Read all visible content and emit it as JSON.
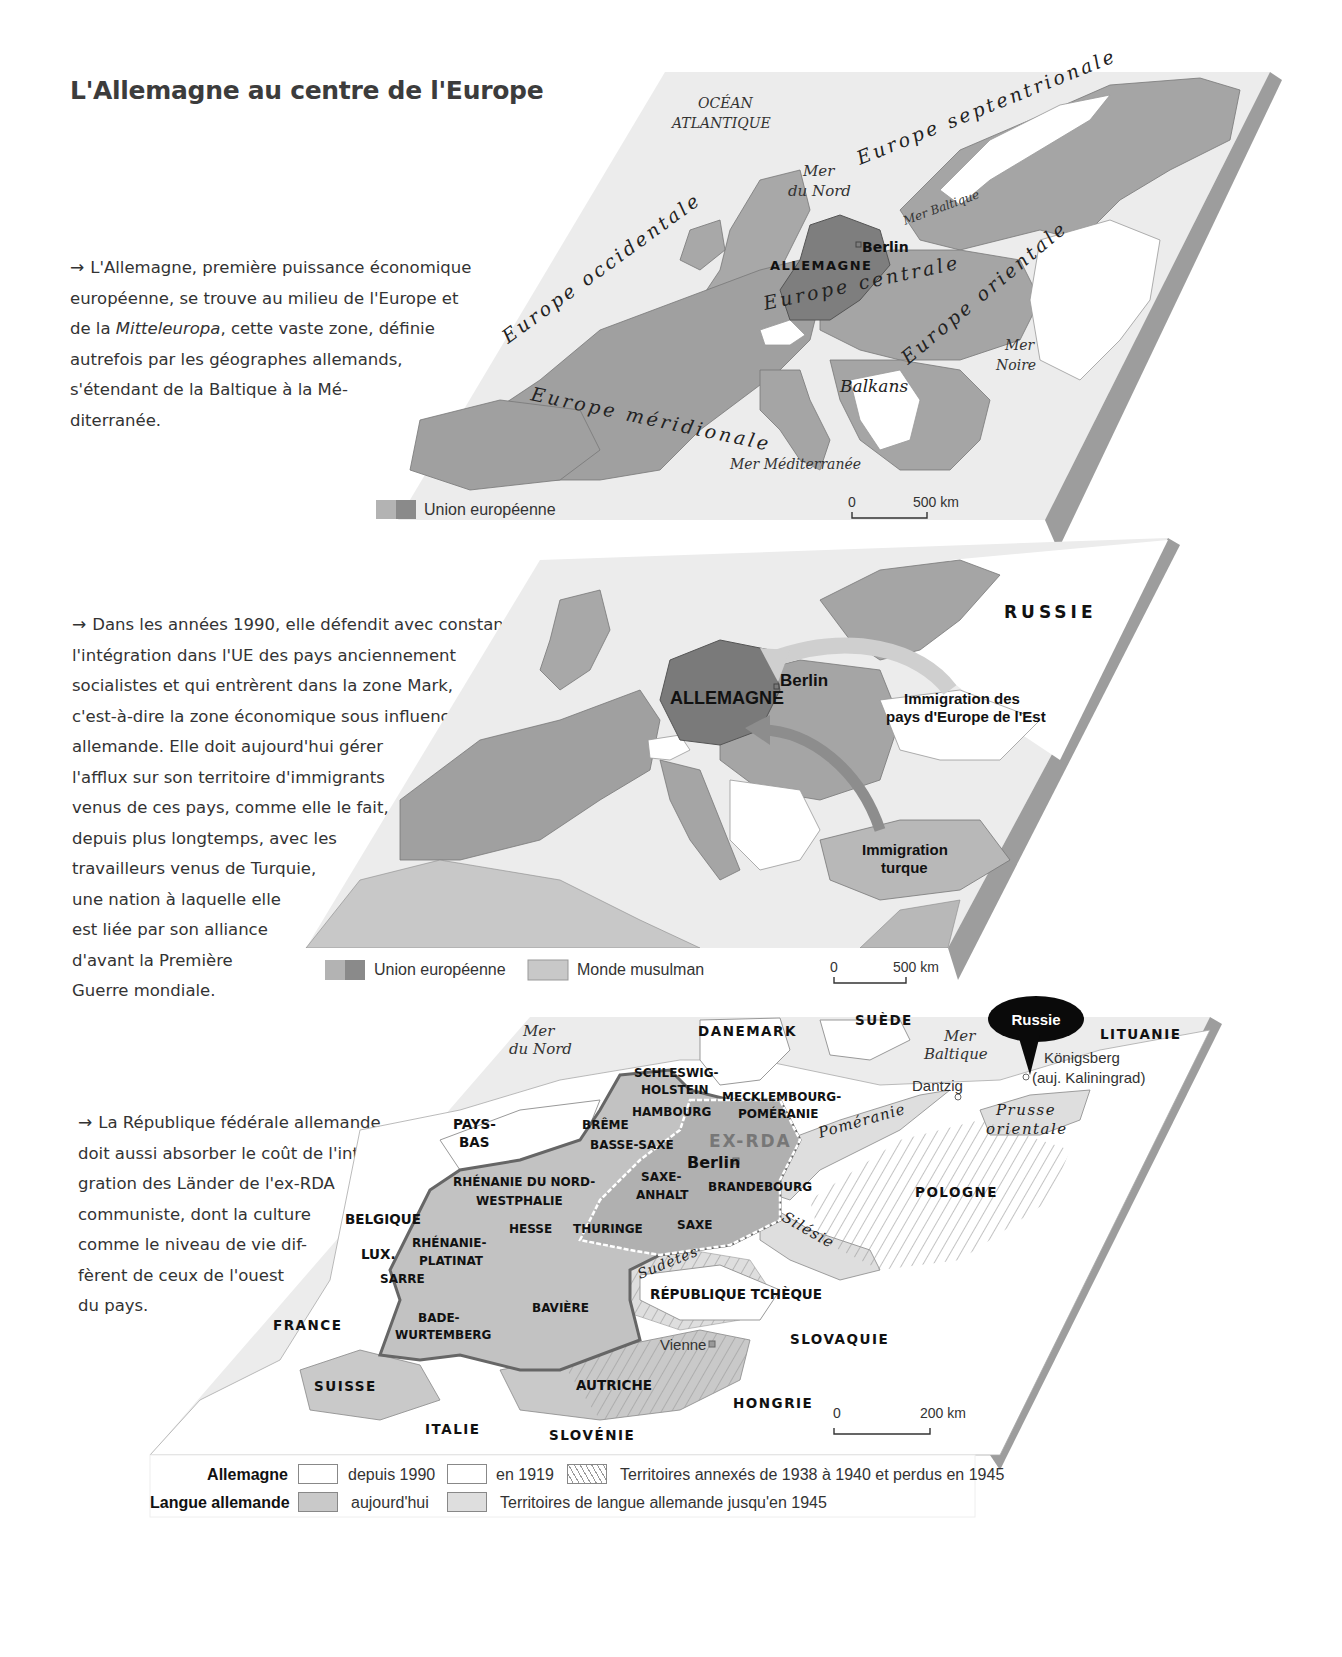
{
  "title": "L'Allemagne au centre de l'Europe",
  "colors": {
    "sea": "#ebebeb",
    "land_eu_light": "#b3b3b3",
    "land_eu_dark": "#8a8a8a",
    "germany": "#7a7a7a",
    "non_eu": "#ffffff",
    "muslim_world": "#c8c8c8",
    "block_side": "#999999",
    "german_language_today": "#c9c9c9",
    "german_language_1945": "#dedede",
    "border_1990": "#666666"
  },
  "section1": {
    "text": {
      "arrow": "→",
      "lines": [
        "L'Allemagne, première puissance économique",
        "européenne, se trouve au milieu de l'Europe et",
        "de la",
        "Mitteleuropa",
        ", cette vaste zone, définie",
        "autrefois par les géographes allemands,",
        "s'étendant de la Baltique à la Mé-",
        "diterranée."
      ]
    },
    "map": {
      "sea_labels": [
        "OCÉAN",
        "ATLANTIQUE",
        "Mer",
        "du Nord",
        "Mer Baltique",
        "Mer",
        "Noire",
        "Mer Méditerranée"
      ],
      "region_labels": [
        "Europe septentrionale",
        "Europe occidentale",
        "Europe centrale",
        "Europe orientale",
        "Europe méridionale",
        "Balkans"
      ],
      "country_label": "ALLEMAGNE",
      "capital": "Berlin"
    },
    "legend": {
      "eu": "Union européenne"
    },
    "scale": {
      "zero": "0",
      "value": "500 km"
    }
  },
  "section2": {
    "text": {
      "arrow": "→",
      "lines": [
        "Dans les années 1990, elle défendit avec constance",
        "l'intégration dans l'UE des pays anciennement",
        "socialistes et qui entrèrent dans la zone Mark,",
        "c'est-à-dire la zone économique sous influence",
        "allemande. Elle doit aujourd'hui gérer",
        "l'afflux sur son territoire d'immigrants",
        "venus de ces pays, comme elle le fait,",
        "depuis plus longtemps, avec les",
        "travailleurs venus de Turquie,",
        "une nation à laquelle elle",
        "est liée par son alliance",
        "d'avant la Première",
        "Guerre mondiale."
      ]
    },
    "map": {
      "country_label": "ALLEMAGNE",
      "capital": "Berlin",
      "russia": "RUSSIE",
      "arrow_east": [
        "Immigration des",
        "pays d'Europe de l'Est"
      ],
      "arrow_turkey": [
        "Immigration",
        "turque"
      ]
    },
    "legend": {
      "eu": "Union européenne",
      "muslim": "Monde musulman"
    },
    "scale": {
      "zero": "0",
      "value": "500 km"
    }
  },
  "section3": {
    "text": {
      "arrow": "→",
      "lines": [
        "La République fédérale allemande",
        "doit aussi absorber le coût de l'inté-",
        "gration des Länder de l'ex-RDA",
        "communiste, dont la culture",
        "comme le niveau de vie dif-",
        "fèrent de ceux de l'ouest",
        "du pays."
      ]
    },
    "map": {
      "seas": [
        "Mer",
        "du Nord",
        "Mer",
        "Baltique"
      ],
      "countries": [
        "DANEMARK",
        "SUÈDE",
        "LITUANIE",
        "PAYS-",
        "BAS",
        "BELGIQUE",
        "LUX.",
        "FRANCE",
        "SUISSE",
        "ITALIE",
        "SLOVÉNIE",
        "AUTRICHE",
        "HONGRIE",
        "SLOVAQUIE",
        "RÉPUBLIQUE TCHÈQUE",
        "POLOGNE"
      ],
      "lander": [
        "SCHLESWIG-",
        "HOLSTEIN",
        "HAMBOURG",
        "MECKLEMBOURG-",
        "POMÉRANIE",
        "BRÊME",
        "BASSE-SAXE",
        "EX-RDA",
        "Berlin",
        "SAXE-",
        "ANHALT",
        "BRANDEBOURG",
        "RHÉNANIE DU NORD-",
        "WESTPHALIE",
        "HESSE",
        "THURINGE",
        "SAXE",
        "RHÉNANIE-",
        "PLATINAT",
        "SARRE",
        "BAVIÈRE",
        "BADE-",
        "WURTEMBERG"
      ],
      "historic": [
        "Poméranie",
        "Silésie",
        "Sudètes",
        "Prusse",
        "orientale"
      ],
      "cities": [
        "Dantzig",
        "Königsberg",
        "(auj. Kaliningrad)",
        "Vienne"
      ],
      "callout": "Russie"
    },
    "scale": {
      "zero": "0",
      "value": "200 km"
    },
    "legend": {
      "row1_title": "Allemagne",
      "since_1990": "depuis 1990",
      "in_1919": "en 1919",
      "annexed": "Territoires annexés de 1938 à 1940 et perdus en 1945",
      "row2_title": "Langue allemande",
      "today": "aujourd'hui",
      "until_1945": "Territoires de langue allemande jusqu'en 1945"
    }
  }
}
